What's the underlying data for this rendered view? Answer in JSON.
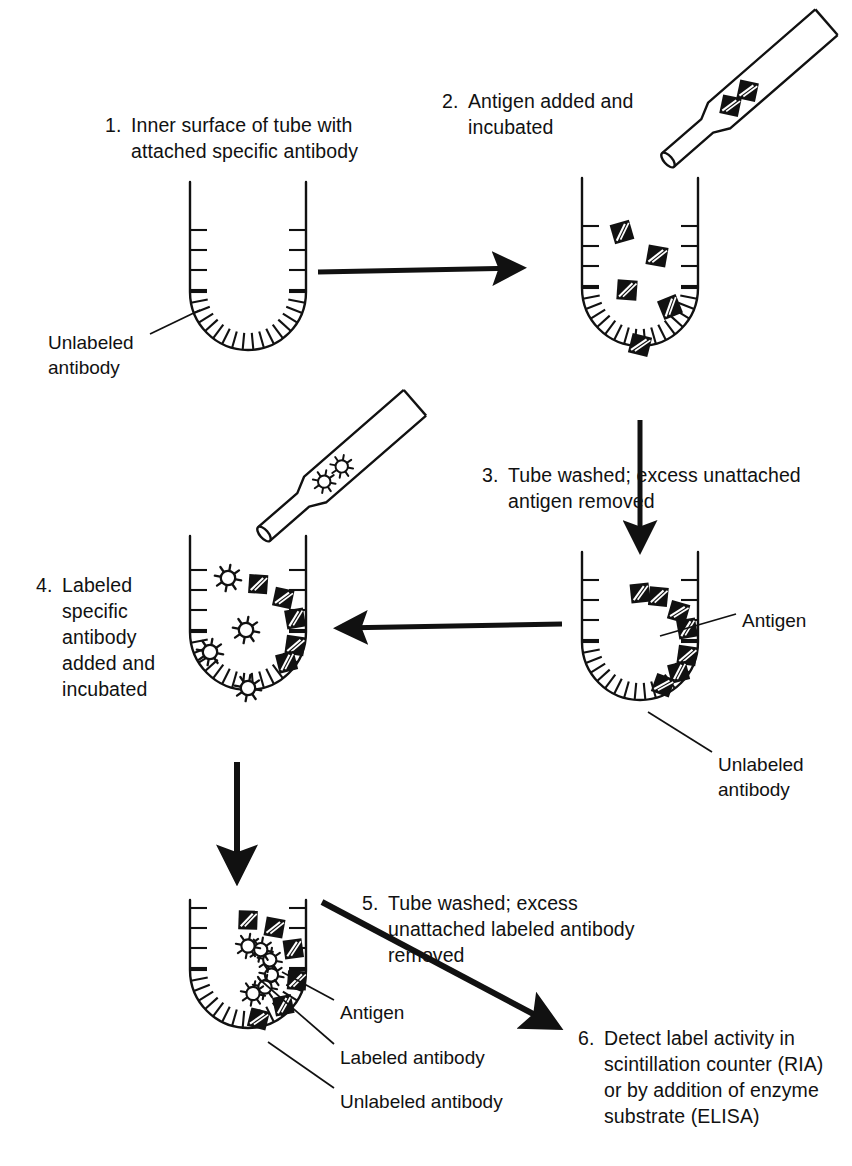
{
  "figure": {
    "background_color": "#ffffff",
    "ink_color": "#111111"
  },
  "steps": [
    {
      "id": "step-1",
      "number": "1.",
      "text": "Inner surface of tube with\nattached specific antibody",
      "x": 105,
      "y": 112
    },
    {
      "id": "step-2",
      "number": "2.",
      "text": "Antigen added and\nincubated",
      "x": 442,
      "y": 88
    },
    {
      "id": "step-3",
      "number": "3.",
      "text": "Tube washed; excess unattached\nantigen removed",
      "x": 482,
      "y": 462
    },
    {
      "id": "step-4",
      "number": "4.",
      "text": "Labeled\nspecific\nantibody\naatt",
      "x": 36,
      "y": 572
    },
    {
      "id": "step-5",
      "number": "5.",
      "text": "Tube washed; excess\nunattached labeled antibody\nremoved",
      "x": 362,
      "y": 890
    },
    {
      "id": "step-6",
      "number": "6.",
      "text": "Detect label activity in\nscintillation counter (RIA)\nor by addition of enzyme\nsubstrate (ELISA)",
      "x": 578,
      "y": 1025
    }
  ],
  "step4_lines": [
    "Labeled",
    "specific",
    "antibody",
    "added and",
    "incubated"
  ],
  "callouts": [
    {
      "id": "callout-tube1-unlabeled-antibody",
      "text": "Unlabeled\nantibody",
      "x": 48,
      "y": 330
    },
    {
      "id": "callout-tube3-antigen",
      "text": "Antigen",
      "x": 742,
      "y": 608
    },
    {
      "id": "callout-tube3-unlabeled-antibody",
      "text": "Unlabeled\nantibody",
      "x": 718,
      "y": 752
    },
    {
      "id": "callout-tube5-antigen",
      "text": "Antigen",
      "x": 340,
      "y": 1000
    },
    {
      "id": "callout-tube5-labeled-antibody",
      "text": "Labeled antibody",
      "x": 340,
      "y": 1045
    },
    {
      "id": "callout-tube5-unlabeled-antibody",
      "text": "Unlabeled antibody",
      "x": 340,
      "y": 1089
    }
  ],
  "legend_symbols": {
    "antigen": "black square with white diagonal slashes",
    "labeled_antibody": "white star burst with black outline",
    "unlabeled_antibody": "short radial tick on tube wall"
  },
  "tubes": [
    {
      "id": "tube-1",
      "label": "tube-empty-antibody-coated",
      "cx": 248,
      "top": 182,
      "width": 116,
      "straight_height": 110,
      "antigens": [],
      "stars": [],
      "wall_antigens": []
    },
    {
      "id": "tube-2",
      "label": "tube-antigen-added",
      "cx": 640,
      "top": 178,
      "width": 116,
      "straight_height": 110,
      "antigens": [
        {
          "x": 622,
          "y": 232,
          "r": -16
        },
        {
          "x": 657,
          "y": 256,
          "r": 10
        },
        {
          "x": 627,
          "y": 290,
          "r": 4
        },
        {
          "x": 670,
          "y": 307,
          "r": -22
        },
        {
          "x": 640,
          "y": 345,
          "r": 14
        }
      ],
      "stars": [],
      "wall_antigens": []
    },
    {
      "id": "tube-3",
      "label": "tube-washed-antigen-bound",
      "cx": 640,
      "top": 552,
      "width": 116,
      "straight_height": 90,
      "antigens": [],
      "stars": [],
      "wall_antigens": [
        {
          "angle": 196,
          "r": -10
        },
        {
          "angle": 164,
          "r": 8
        },
        {
          "angle": 218,
          "r": 16
        },
        {
          "angle": 142,
          "r": -14
        },
        {
          "angle": 248,
          "r": 6
        },
        {
          "angle": 118,
          "r": 20
        },
        {
          "angle": 270,
          "r": -6
        }
      ]
    },
    {
      "id": "tube-4",
      "label": "tube-labeled-antibody-added",
      "cx": 248,
      "top": 536,
      "width": 116,
      "straight_height": 96,
      "antigens": [],
      "stars": [
        {
          "x": 228,
          "y": 578
        },
        {
          "x": 246,
          "y": 630
        },
        {
          "x": 210,
          "y": 652
        },
        {
          "x": 248,
          "y": 688
        }
      ],
      "wall_antigens": [
        {
          "angle": 164,
          "r": 8
        },
        {
          "angle": 196,
          "r": -10
        },
        {
          "angle": 142,
          "r": -14
        },
        {
          "angle": 224,
          "r": 12
        },
        {
          "angle": 258,
          "r": 4
        }
      ]
    },
    {
      "id": "tube-5",
      "label": "tube-final-sandwich-complex",
      "cx": 248,
      "top": 900,
      "width": 116,
      "straight_height": 70,
      "antigens": [],
      "stars": [],
      "wall_antigens": []
    }
  ],
  "pipettes": [
    {
      "id": "pipette-antigen",
      "label": "pipette-dispensing-antigen",
      "tip_x": 668,
      "tip_y": 160,
      "angle": -41,
      "length": 210,
      "contents": "antigen",
      "items": [
        0.52,
        0.7
      ]
    },
    {
      "id": "pipette-labeled-antibody",
      "label": "pipette-dispensing-labeled-antibody",
      "tip_x": 264,
      "tip_y": 534,
      "angle": -41,
      "length": 200,
      "contents": "star",
      "items": [
        0.5,
        0.7
      ]
    }
  ],
  "arrows": [
    {
      "id": "arrow-1-to-2",
      "x1": 318,
      "y1": 272,
      "x2": 520,
      "y2": 268,
      "width": 5
    },
    {
      "id": "arrow-2-to-3",
      "x1": 640,
      "y1": 420,
      "x2": 640,
      "y2": 548,
      "width": 5
    },
    {
      "id": "arrow-3-to-4",
      "x1": 562,
      "y1": 624,
      "x2": 340,
      "y2": 628,
      "width": 5
    },
    {
      "id": "arrow-4-to-5",
      "x1": 237,
      "y1": 762,
      "x2": 237,
      "y2": 878,
      "width": 6
    },
    {
      "id": "arrow-5-to-6",
      "x1": 322,
      "y1": 902,
      "x2": 556,
      "y2": 1026,
      "width": 6
    }
  ],
  "leader_lines": [
    {
      "id": "leader-tube1-unlabeled-antibody",
      "x1": 150,
      "y1": 334,
      "x2": 200,
      "y2": 310
    },
    {
      "id": "leader-tube3-antigen",
      "x1": 736,
      "y1": 614,
      "x2": 660,
      "y2": 636
    },
    {
      "id": "leader-tube3-unlabeled-antibody",
      "x1": 712,
      "y1": 752,
      "x2": 648,
      "y2": 712
    },
    {
      "id": "leader-tube5-antigen",
      "x1": 334,
      "y1": 1000,
      "x2": 282,
      "y2": 972
    },
    {
      "id": "leader-tube5-labeled-antibody",
      "x1": 334,
      "y1": 1044,
      "x2": 258,
      "y2": 978
    },
    {
      "id": "leader-tube5-unlabeled-antibody",
      "x1": 334,
      "y1": 1088,
      "x2": 268,
      "y2": 1042
    }
  ]
}
